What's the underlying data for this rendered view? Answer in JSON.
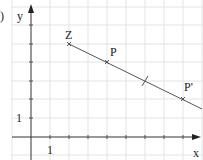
{
  "figure": {
    "part_label": ")",
    "axes": {
      "x_label": "x",
      "y_label": "y",
      "x_unit_label": "1",
      "y_unit_label": "1"
    },
    "grid": {
      "origin_px": [
        31,
        137
      ],
      "unit_x_px": 19,
      "unit_y_px": 18.6
    },
    "points": [
      {
        "name": "Z",
        "label": "Z",
        "x": 2,
        "y": 5
      },
      {
        "name": "P",
        "label": "P",
        "x": 4,
        "y": 4
      },
      {
        "name": "P-prime",
        "label": "P'",
        "x": 8,
        "y": 2
      }
    ],
    "midpoint_mark": {
      "x": 6,
      "y": 3
    },
    "line": {
      "from": [
        2,
        5
      ],
      "to": [
        9,
        1.5
      ]
    },
    "colors": {
      "grid": "#e3e3e3",
      "axis": "#333333",
      "line": "#555555",
      "text": "#222222"
    }
  }
}
